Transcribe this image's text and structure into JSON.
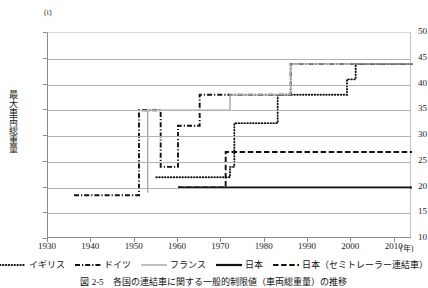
{
  "axes": {
    "y_unit": "(t)",
    "y_title": "最大車両総重量",
    "x_unit": "(年)",
    "y_ticks": [
      "10",
      "15",
      "20",
      "25",
      "30",
      "35",
      "40",
      "45",
      "50"
    ],
    "x_ticks": [
      "1930",
      "1940",
      "1950",
      "1960",
      "1970",
      "1980",
      "1990",
      "2000",
      "2010"
    ]
  },
  "legend": {
    "items": [
      {
        "label": "イギリス",
        "style": "dotted",
        "color": "#111111",
        "name": "legend-uk"
      },
      {
        "label": "ドイツ",
        "style": "dashdot",
        "color": "#111111",
        "name": "legend-germany"
      },
      {
        "label": "フランス",
        "style": "solid-gray",
        "color": "#a6a6a6",
        "name": "legend-france"
      },
      {
        "label": "日本",
        "style": "solid-black",
        "color": "#111111",
        "name": "legend-japan"
      },
      {
        "label": "日本（セミトレーラー連結車）",
        "style": "dashed",
        "color": "#111111",
        "name": "legend-japan-semitrailer"
      }
    ]
  },
  "caption": "図 2-5　各国の連結車に関する一般的制限値（車両総重量）の推移",
  "chart_data": {
    "type": "line",
    "title": "",
    "xlabel": "年",
    "ylabel": "最大車両総重量",
    "yunit": "t",
    "xlim": [
      1930,
      2014
    ],
    "ylim": [
      10,
      50
    ],
    "ytick_step": 5,
    "xtick_step": 10,
    "grid": "horizontal",
    "legend_position": "bottom",
    "step_interpolation": true,
    "series": [
      {
        "name": "イギリス",
        "style": "dotted",
        "color": "#111111",
        "points": [
          {
            "x": 1955,
            "y": 22
          },
          {
            "x": 1972,
            "y": 22
          },
          {
            "x": 1972,
            "y": 24
          },
          {
            "x": 1973,
            "y": 24
          },
          {
            "x": 1973,
            "y": 32.5
          },
          {
            "x": 1983,
            "y": 32.5
          },
          {
            "x": 1983,
            "y": 38
          },
          {
            "x": 1999,
            "y": 38
          },
          {
            "x": 1999,
            "y": 41
          },
          {
            "x": 2001,
            "y": 41
          },
          {
            "x": 2001,
            "y": 44
          },
          {
            "x": 2014,
            "y": 44
          }
        ]
      },
      {
        "name": "ドイツ",
        "style": "dashdot",
        "color": "#111111",
        "points": [
          {
            "x": 1936,
            "y": 18.5
          },
          {
            "x": 1951,
            "y": 18.5
          },
          {
            "x": 1951,
            "y": 35
          },
          {
            "x": 1953,
            "y": 35
          },
          {
            "x": 1956,
            "y": 35
          },
          {
            "x": 1956,
            "y": 24
          },
          {
            "x": 1960,
            "y": 24
          },
          {
            "x": 1960,
            "y": 32
          },
          {
            "x": 1965,
            "y": 32
          },
          {
            "x": 1965,
            "y": 38
          },
          {
            "x": 1970,
            "y": 38
          },
          {
            "x": 1970,
            "y": 38
          },
          {
            "x": 1986,
            "y": 38
          },
          {
            "x": 1986,
            "y": 44
          },
          {
            "x": 2014,
            "y": 44
          }
        ]
      },
      {
        "name": "フランス",
        "style": "solid-gray",
        "color": "#a6a6a6",
        "points": [
          {
            "x": 1953,
            "y": 19
          },
          {
            "x": 1953,
            "y": 35
          },
          {
            "x": 1972,
            "y": 35
          },
          {
            "x": 1972,
            "y": 38
          },
          {
            "x": 1986,
            "y": 38
          },
          {
            "x": 1986,
            "y": 40
          },
          {
            "x": 1986,
            "y": 44
          },
          {
            "x": 2014,
            "y": 44
          }
        ]
      },
      {
        "name": "日本",
        "style": "solid-black",
        "color": "#111111",
        "points": [
          {
            "x": 1960,
            "y": 20
          },
          {
            "x": 2014,
            "y": 20
          }
        ]
      },
      {
        "name": "日本（セミトレーラー連結車）",
        "style": "dashed",
        "color": "#111111",
        "points": [
          {
            "x": 1960,
            "y": 20
          },
          {
            "x": 1971,
            "y": 20
          },
          {
            "x": 1971,
            "y": 26.9
          },
          {
            "x": 2014,
            "y": 26.9
          }
        ]
      }
    ]
  }
}
